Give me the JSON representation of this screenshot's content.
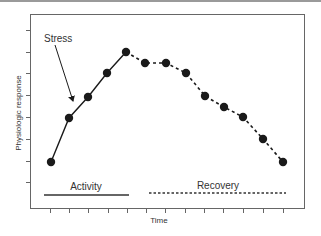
{
  "chart_data": {
    "type": "line",
    "title": "",
    "xlabel": "Time",
    "ylabel": "Physiologic response",
    "x_tick_count": 13,
    "y_tick_count": 8,
    "grid": false,
    "legend": "none",
    "annotations": [
      {
        "text": "Stress",
        "points_to": "second data point (onset of activity rise)"
      },
      {
        "text": "Activity",
        "style": "solid line",
        "span": "x ticks 1-5"
      },
      {
        "text": "Recovery",
        "style": "dashed line",
        "span": "x ticks 6-13"
      }
    ],
    "series": [
      {
        "name": "Activity",
        "style": "solid",
        "x": [
          1,
          2,
          3,
          4,
          5
        ],
        "y": [
          2.1,
          4.1,
          5.1,
          6.2,
          7.1
        ]
      },
      {
        "name": "Recovery",
        "style": "dashed",
        "x": [
          5,
          6,
          7,
          8,
          9,
          10,
          11,
          12,
          13
        ],
        "y": [
          7.1,
          6.6,
          6.6,
          6.2,
          5.1,
          4.6,
          4.1,
          3.1,
          2.1
        ]
      }
    ],
    "ylim": [
      0,
      8.5
    ],
    "xlim": [
      0,
      14
    ]
  },
  "labels": {
    "stress": "Stress",
    "activity": "Activity",
    "recovery": "Recovery",
    "xlabel": "Time",
    "ylabel": "Physiologic response"
  },
  "layout": {
    "frame": {
      "x": 30,
      "y": 14,
      "w": 274,
      "h": 194
    },
    "x_ticks_px": [
      50,
      69,
      88,
      108,
      127,
      146,
      165,
      185,
      204,
      223,
      243,
      263,
      283
    ],
    "y_ticks_px": [
      30,
      52,
      73,
      95,
      117,
      139,
      161,
      182
    ],
    "activity_points_px": [
      [
        51,
        162
      ],
      [
        69,
        118
      ],
      [
        88,
        97
      ],
      [
        107,
        73
      ],
      [
        126,
        52
      ]
    ],
    "recovery_points_px": [
      [
        126,
        52
      ],
      [
        145,
        63
      ],
      [
        166,
        63
      ],
      [
        186,
        73
      ],
      [
        205,
        96
      ],
      [
        224,
        107
      ],
      [
        243,
        117
      ],
      [
        263,
        139
      ],
      [
        283,
        162
      ]
    ],
    "stress_arrow_px": {
      "from": [
        55,
        45
      ],
      "to": [
        73,
        101
      ]
    },
    "activity_bar_px": {
      "x1": 44,
      "x2": 129,
      "y": 195
    },
    "recovery_bar_px": {
      "x1": 149,
      "x2": 286,
      "y": 193
    }
  },
  "colors": {
    "ink": "#1a1a1a",
    "frame": "#555555",
    "text": "#333333"
  }
}
